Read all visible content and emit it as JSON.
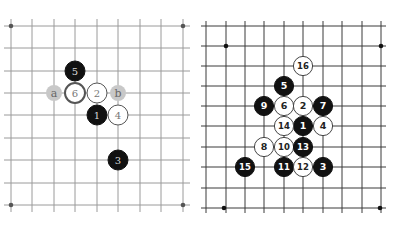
{
  "colors": {
    "background": "#ffffff",
    "left_grid": "#9a9a9a",
    "right_grid": "#3a3a3a",
    "black_stone": "#111111",
    "white_stone": "#ffffff",
    "marker": "#c8c8c8"
  },
  "left_board": {
    "columns": [
      11,
      32,
      54,
      75,
      97,
      118,
      140,
      161,
      183
    ],
    "rows": [
      26,
      48,
      71,
      93,
      115,
      138,
      160,
      183,
      205
    ],
    "star_points": [
      [
        11,
        26
      ],
      [
        183,
        26
      ],
      [
        11,
        205
      ],
      [
        183,
        205
      ]
    ],
    "stones": [
      {
        "label": "1",
        "color": "black",
        "x": 97,
        "y": 115
      },
      {
        "label": "2",
        "color": "white",
        "x": 97,
        "y": 93
      },
      {
        "label": "3",
        "color": "black",
        "x": 118,
        "y": 160
      },
      {
        "label": "4",
        "color": "white",
        "x": 118,
        "y": 115
      },
      {
        "label": "5",
        "color": "black",
        "x": 75,
        "y": 71
      },
      {
        "label": "6",
        "color": "white",
        "x": 75,
        "y": 93,
        "emphasis": true
      }
    ],
    "markers": [
      {
        "label": "a",
        "x": 54,
        "y": 93
      },
      {
        "label": "b",
        "x": 118,
        "y": 93
      }
    ]
  },
  "right_board": {
    "columns": [
      206,
      226,
      245,
      264,
      284,
      303,
      323,
      342,
      362,
      381
    ],
    "rows": [
      26,
      46,
      66,
      86,
      106,
      126,
      147,
      167,
      188,
      208
    ],
    "star_points": [
      [
        226,
        46
      ],
      [
        381,
        46
      ],
      [
        224,
        208
      ],
      [
        380,
        208
      ]
    ],
    "stones": [
      {
        "label": "1",
        "color": "black",
        "x": 303,
        "y": 126
      },
      {
        "label": "2",
        "color": "white",
        "x": 303,
        "y": 106
      },
      {
        "label": "3",
        "color": "black",
        "x": 323,
        "y": 167
      },
      {
        "label": "4",
        "color": "white",
        "x": 323,
        "y": 126
      },
      {
        "label": "5",
        "color": "black",
        "x": 284,
        "y": 86
      },
      {
        "label": "6",
        "color": "white",
        "x": 284,
        "y": 106
      },
      {
        "label": "7",
        "color": "black",
        "x": 323,
        "y": 106
      },
      {
        "label": "8",
        "color": "white",
        "x": 264,
        "y": 147
      },
      {
        "label": "9",
        "color": "black",
        "x": 264,
        "y": 106
      },
      {
        "label": "10",
        "color": "white",
        "x": 284,
        "y": 147
      },
      {
        "label": "11",
        "color": "black",
        "x": 284,
        "y": 167
      },
      {
        "label": "12",
        "color": "white",
        "x": 303,
        "y": 167
      },
      {
        "label": "13",
        "color": "black",
        "x": 303,
        "y": 147
      },
      {
        "label": "14",
        "color": "white",
        "x": 284,
        "y": 126
      },
      {
        "label": "15",
        "color": "black",
        "x": 245,
        "y": 167
      },
      {
        "label": "16",
        "color": "white",
        "x": 303,
        "y": 66
      }
    ]
  }
}
